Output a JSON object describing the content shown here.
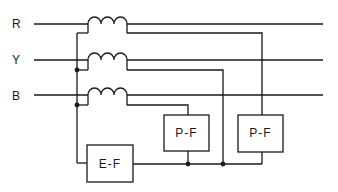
{
  "diagram": {
    "title": "",
    "phases": [
      {
        "label": "R",
        "y": 24
      },
      {
        "label": "Y",
        "y": 60
      },
      {
        "label": "B",
        "y": 95
      }
    ],
    "relays": {
      "pf_left": {
        "label": "P-F"
      },
      "pf_right": {
        "label": "P-F"
      },
      "ef": {
        "label": "E-F"
      }
    },
    "colors": {
      "line": "#1a1a1a",
      "background": "#ffffff"
    }
  }
}
